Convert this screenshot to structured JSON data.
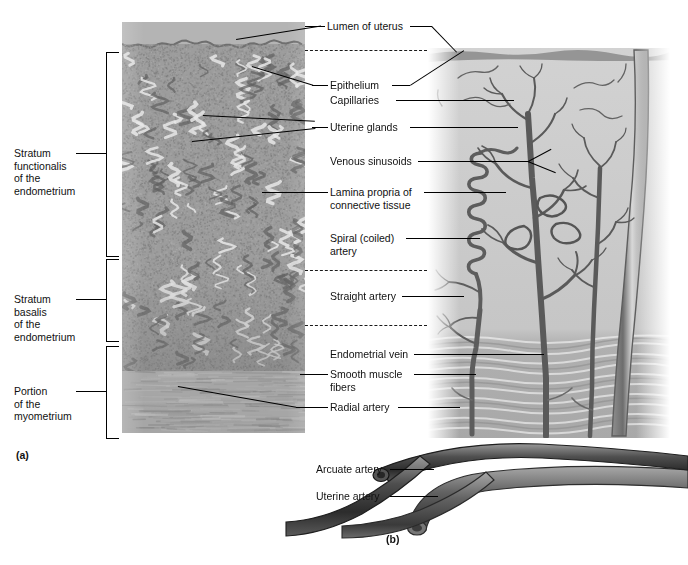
{
  "figure": {
    "panel_a_caption": "(a)",
    "panel_b_caption": "(b)"
  },
  "brackets": [
    {
      "id": "stratum-functionalis",
      "lines": [
        "Stratum",
        "functionalis",
        "of the",
        "endometrium"
      ]
    },
    {
      "id": "stratum-basalis",
      "lines": [
        "Stratum",
        "basalis",
        "of the",
        "endometrium"
      ]
    },
    {
      "id": "portion-myometrium",
      "lines": [
        "Portion",
        "of the",
        "myometrium"
      ]
    }
  ],
  "labels": {
    "lumen_of_uterus": "Lumen of uterus",
    "epithelium": "Epithelium",
    "capillaries": "Capillaries",
    "uterine_glands": "Uterine glands",
    "venous_sinusoids": "Venous sinusoids",
    "lamina_propria_l1": "Lamina propria of",
    "lamina_propria_l2": "connective tissue",
    "spiral_artery_l1": "Spiral (coiled)",
    "spiral_artery_l2": "artery",
    "straight_artery": "Straight artery",
    "endometrial_vein": "Endometrial vein",
    "smooth_muscle_l1": "Smooth muscle",
    "smooth_muscle_l2": "fibers",
    "radial_artery": "Radial artery",
    "arcuate_artery": "Arcuate artery",
    "uterine_artery": "Uterine artery"
  },
  "colors": {
    "background": "#ffffff",
    "text": "#111111",
    "leader": "#000000",
    "histology_tissue": "#9d9d9d",
    "histology_lumen": "#b4b4b4",
    "illustration_tissue": "#c9c9c9",
    "vessel_dark": "#5a5a5a",
    "vessel_outline": "#4a4a4a",
    "myometrium": "#a6a6a6"
  }
}
